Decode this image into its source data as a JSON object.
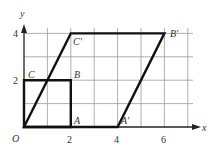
{
  "diagram": {
    "type": "coordinate-plane-transformation",
    "axes": {
      "x_label": "x",
      "y_label": "y",
      "origin_label": "O",
      "x_ticks": [
        {
          "value": 2,
          "label": "2"
        },
        {
          "value": 4,
          "label": "4"
        },
        {
          "value": 6,
          "label": "6"
        }
      ],
      "y_ticks": [
        {
          "value": 2,
          "label": "2"
        },
        {
          "value": 4,
          "label": "4"
        }
      ],
      "grid_x_max": 7,
      "grid_y_max": 4
    },
    "original_shape": {
      "name": "square OABC",
      "vertices": [
        {
          "label": "O",
          "x": 0,
          "y": 0
        },
        {
          "label": "A",
          "x": 2,
          "y": 0
        },
        {
          "label": "B",
          "x": 2,
          "y": 2
        },
        {
          "label": "C",
          "x": 0,
          "y": 2
        }
      ]
    },
    "transformed_shape": {
      "name": "parallelogram OA'B'C'",
      "vertices": [
        {
          "label": "O",
          "x": 0,
          "y": 0
        },
        {
          "label": "A'",
          "x": 4,
          "y": 0
        },
        {
          "label": "B'",
          "x": 6,
          "y": 4
        },
        {
          "label": "C'",
          "x": 2,
          "y": 4
        }
      ]
    },
    "labels": {
      "O": "O",
      "A": "A",
      "B": "B",
      "C": "C",
      "A_prime": "A′",
      "B_prime": "B′",
      "C_prime": "C′",
      "tick_x_2": "2",
      "tick_x_4": "4",
      "tick_x_6": "6",
      "tick_y_2": "2",
      "tick_y_4": "4"
    },
    "colors": {
      "grid": "#9a9a9a",
      "shape": "#111111",
      "axis": "#222222"
    }
  }
}
